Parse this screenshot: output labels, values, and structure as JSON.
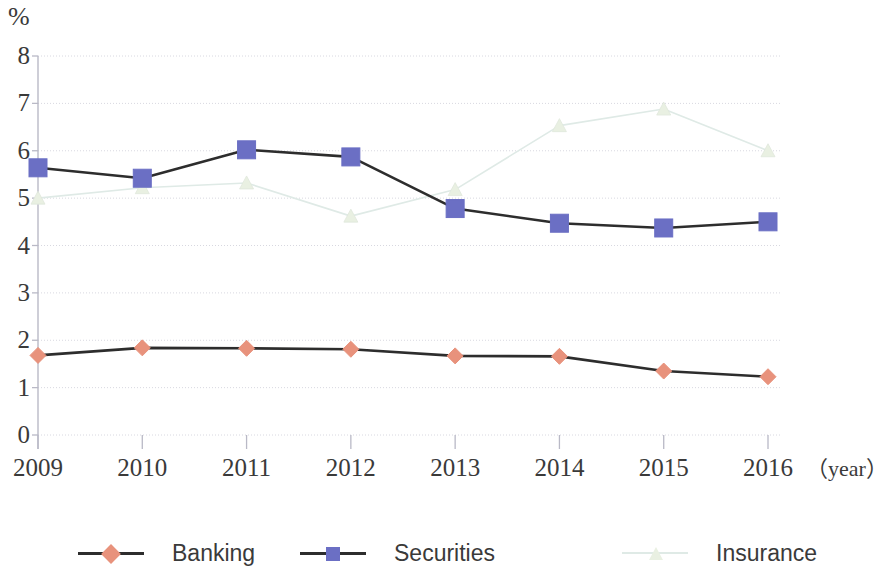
{
  "chart_data": {
    "type": "line",
    "title": "",
    "subtitle": "",
    "xlabel": "（year）",
    "ylabel": "%",
    "categories": [
      "2009",
      "2010",
      "2011",
      "2012",
      "2013",
      "2014",
      "2015",
      "2016"
    ],
    "x": [
      2009,
      2010,
      2011,
      2012,
      2013,
      2014,
      2015,
      2016
    ],
    "ylim": [
      0,
      8
    ],
    "ytick_labels": [
      "0",
      "1",
      "2",
      "3",
      "4",
      "5",
      "6",
      "7",
      "8"
    ],
    "ytick_values": [
      0,
      1,
      2,
      3,
      4,
      5,
      6,
      7,
      8
    ],
    "grid": true,
    "grid_axis": "y",
    "legend_position": "bottom",
    "series": [
      {
        "name": "Banking",
        "marker": "diamond",
        "marker_color": "#e8927c",
        "line_color": "#2d2d2d",
        "values": [
          1.68,
          1.84,
          1.83,
          1.81,
          1.67,
          1.66,
          1.35,
          1.23
        ]
      },
      {
        "name": "Securities",
        "marker": "square",
        "marker_color": "#6b6fc4",
        "line_color": "#2d2d2d",
        "values": [
          5.64,
          5.42,
          6.02,
          5.87,
          4.78,
          4.47,
          4.37,
          4.5
        ]
      },
      {
        "name": "Insurance",
        "marker": "triangle",
        "marker_color": "#e9f0e2",
        "line_color": "#dfeae6",
        "values": [
          5.0,
          5.22,
          5.32,
          4.62,
          5.18,
          6.53,
          6.88,
          6.0
        ]
      }
    ]
  },
  "axes": {
    "unit_label": "%",
    "x_axis_suffix": "（year）"
  },
  "colors": {
    "banking": "#e8927c",
    "securities": "#6b6fc4",
    "insurance": "#e3ece5",
    "line_dark": "#2d2d2d",
    "grid": "#d8d8e0",
    "axis": "#b9b9c6"
  }
}
